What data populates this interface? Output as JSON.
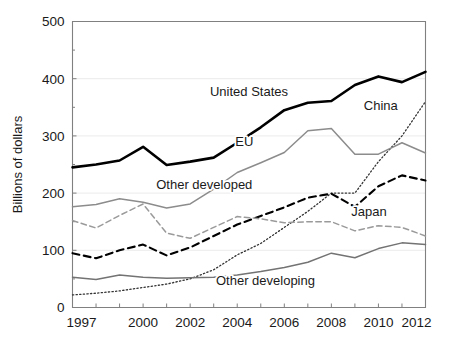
{
  "chart_data": {
    "type": "line",
    "title": "",
    "subtitle": "",
    "xlabel": "",
    "ylabel": "Billions of dollars",
    "xlim": [
      1997,
      2012
    ],
    "ylim": [
      0,
      500
    ],
    "ytick_labels": [
      "0",
      "100",
      "200",
      "300",
      "400",
      "500"
    ],
    "ytick_values": [
      0,
      100,
      200,
      300,
      400,
      500
    ],
    "xtick_labels": [
      "1997",
      "2000",
      "2002",
      "2004",
      "2006",
      "2008",
      "2010",
      "2012"
    ],
    "xtick_values": [
      1997,
      2000,
      2002,
      2004,
      2006,
      2008,
      2010,
      2012
    ],
    "x_minor_ticks": [
      1997,
      1998,
      1999,
      2000,
      2001,
      2002,
      2003,
      2004,
      2005,
      2006,
      2007,
      2008,
      2009,
      2010,
      2011,
      2012
    ],
    "grid": "horizontal-light",
    "legend_position": "inline-annotations",
    "x": [
      1997,
      1998,
      1999,
      2000,
      2001,
      2002,
      2003,
      2004,
      2005,
      2006,
      2007,
      2008,
      2009,
      2010,
      2011,
      2012
    ],
    "series": [
      {
        "name": "United States",
        "label": "United States",
        "style": "solid-thick",
        "color": "#000000",
        "width": 2.6,
        "label_x": 2004.5,
        "label_y": 370,
        "values": [
          245,
          250,
          257,
          281,
          249,
          255,
          262,
          288,
          315,
          345,
          358,
          361,
          389,
          404,
          394,
          412
        ]
      },
      {
        "name": "China",
        "label": "China",
        "style": "dotted",
        "color": "#333333",
        "width": 1.3,
        "label_x": 2010.1,
        "label_y": 345,
        "values": [
          22,
          25,
          29,
          35,
          41,
          50,
          66,
          92,
          112,
          140,
          168,
          200,
          200,
          255,
          300,
          360
        ]
      },
      {
        "name": "EU",
        "label": "EU",
        "style": "solid-thin",
        "color": "#8c8c8c",
        "width": 1.5,
        "label_x": 2004.3,
        "label_y": 283,
        "values": [
          176,
          180,
          190,
          184,
          174,
          181,
          207,
          236,
          253,
          271,
          309,
          313,
          268,
          268,
          288,
          270
        ]
      },
      {
        "name": "Other developed",
        "label": "Other developed",
        "style": "dashed-thick",
        "color": "#000000",
        "width": 2.1,
        "label_x": 2002.6,
        "label_y": 208,
        "values": [
          95,
          86,
          100,
          110,
          91,
          105,
          125,
          145,
          160,
          175,
          192,
          199,
          176,
          212,
          231,
          222
        ]
      },
      {
        "name": "Japan",
        "label": "Japan",
        "style": "dashed-thin",
        "color": "#9a9a9a",
        "width": 1.5,
        "label_x": 2009.6,
        "label_y": 160,
        "values": [
          152,
          139,
          161,
          181,
          130,
          121,
          140,
          159,
          155,
          148,
          150,
          150,
          134,
          143,
          140,
          125
        ]
      },
      {
        "name": "Other developing",
        "label": "Other developing",
        "style": "solid-thin",
        "color": "#737373",
        "width": 1.5,
        "label_x": 2005.2,
        "label_y": 40,
        "values": [
          53,
          49,
          57,
          53,
          51,
          52,
          53,
          57,
          63,
          70,
          79,
          95,
          87,
          103,
          113,
          110
        ]
      }
    ]
  }
}
